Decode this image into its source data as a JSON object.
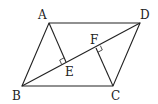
{
  "diagram": {
    "type": "geometry",
    "points": {
      "A": {
        "x": 49,
        "y": 23
      },
      "B": {
        "x": 22,
        "y": 86
      },
      "C": {
        "x": 113,
        "y": 86
      },
      "D": {
        "x": 140,
        "y": 23
      },
      "E": {
        "x": 66,
        "y": 62
      },
      "F": {
        "x": 96,
        "y": 48
      }
    },
    "labels": {
      "A": "A",
      "B": "B",
      "C": "C",
      "D": "D",
      "E": "E",
      "F": "F"
    },
    "segments": [
      "AB",
      "BC",
      "CD",
      "DA",
      "BD",
      "AE",
      "CF"
    ],
    "right_angles": [
      "AEB",
      "CFD"
    ],
    "stroke_color": "#222222"
  }
}
